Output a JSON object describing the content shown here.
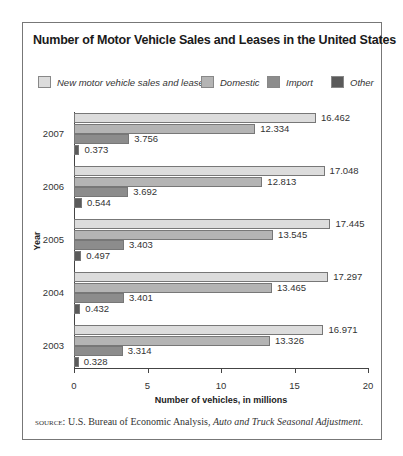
{
  "chart_data": {
    "type": "bar",
    "orientation": "horizontal",
    "title": "Number of Motor Vehicle Sales and Leases in the United States",
    "xlabel": "Number of vehicles, in millions",
    "ylabel": "Year",
    "xlim": [
      0,
      20
    ],
    "xticks": [
      "0",
      "5",
      "10",
      "15",
      "20"
    ],
    "grid": false,
    "legend_position": "top",
    "categories": [
      "2007",
      "2006",
      "2005",
      "2004",
      "2003"
    ],
    "series": [
      {
        "name": "New motor vehicle sales and leases",
        "color": "#dcdcdc",
        "values": [
          16.462,
          17.048,
          17.445,
          17.297,
          16.971
        ],
        "labels": [
          "16.462",
          "17.048",
          "17.445",
          "17.297",
          "16.971"
        ]
      },
      {
        "name": "Domestic",
        "color": "#b4b4b4",
        "values": [
          12.334,
          12.813,
          13.545,
          13.465,
          13.326
        ],
        "labels": [
          "12.334",
          "12.813",
          "13.545",
          "13.465",
          "13.326"
        ]
      },
      {
        "name": "Import",
        "color": "#8c8c8c",
        "values": [
          3.756,
          3.692,
          3.403,
          3.401,
          3.314
        ],
        "labels": [
          "3.756",
          "3.692",
          "3.403",
          "3.401",
          "3.314"
        ]
      },
      {
        "name": "Other",
        "color": "#5a5a5a",
        "values": [
          0.373,
          0.544,
          0.497,
          0.432,
          0.328
        ],
        "labels": [
          "0.373",
          "0.544",
          "0.497",
          "0.432",
          "0.328"
        ]
      }
    ]
  },
  "source": {
    "prefix": "source:",
    "text": " U.S. Bureau of Economic Analysis, ",
    "italic": "Auto and Truck Seasonal Adjustment",
    "suffix": "."
  }
}
